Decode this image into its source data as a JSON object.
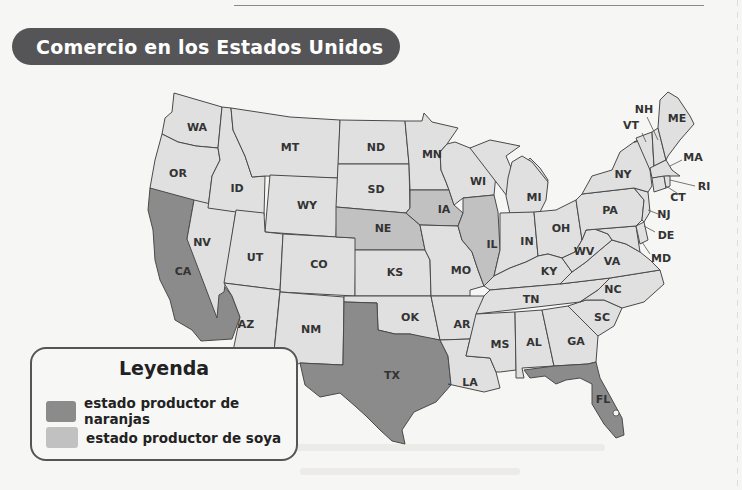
{
  "title": "Comercio en los Estados Unidos",
  "colors": {
    "banner": "#555557",
    "orange_state": "#8b8b8b",
    "soy_state": "#c1c1c1",
    "other_state": "#e0e0e0",
    "border": "#4a4a4a"
  },
  "legend": {
    "title": "Leyenda",
    "items": [
      {
        "label": "estado productor de naranjas",
        "color": "#8b8b8b"
      },
      {
        "label": "estado productor de soya",
        "color": "#c1c1c1"
      }
    ]
  },
  "map": {
    "orange_states": [
      "CA",
      "TX",
      "FL"
    ],
    "soy_states": [
      "NE",
      "IA",
      "IL"
    ],
    "labels": {
      "WA": "WA",
      "OR": "OR",
      "CA": "CA",
      "NV": "NV",
      "ID": "ID",
      "MT": "MT",
      "WY": "WY",
      "UT": "UT",
      "AZ": "AZ",
      "CO": "CO",
      "NM": "NM",
      "ND": "ND",
      "SD": "SD",
      "NE": "NE",
      "KS": "KS",
      "OK": "OK",
      "TX": "TX",
      "MN": "MN",
      "IA": "IA",
      "MO": "MO",
      "AR": "AR",
      "LA": "LA",
      "WI": "WI",
      "IL": "IL",
      "MI": "MI",
      "IN": "IN",
      "OH": "OH",
      "KY": "KY",
      "TN": "TN",
      "MS": "MS",
      "AL": "AL",
      "GA": "GA",
      "FL": "FL",
      "SC": "SC",
      "NC": "NC",
      "VA": "VA",
      "WV": "WV",
      "PA": "PA",
      "NY": "NY",
      "VT": "VT",
      "NH": "NH",
      "ME": "ME",
      "MA": "MA",
      "RI": "RI",
      "CT": "CT",
      "NJ": "NJ",
      "DE": "DE",
      "MD": "MD"
    }
  }
}
